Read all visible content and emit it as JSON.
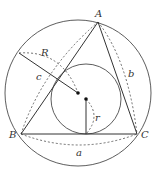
{
  "diagram": {
    "colors": {
      "stroke": "#333333",
      "background": "#ffffff"
    },
    "vertices": {
      "A": {
        "label": "A",
        "x": 98,
        "y": 22
      },
      "B": {
        "label": "B",
        "x": 21,
        "y": 134
      },
      "C": {
        "label": "C",
        "x": 137,
        "y": 134
      }
    },
    "circumcircle": {
      "cx": 78,
      "cy": 93,
      "r": 73
    },
    "incircle": {
      "cx": 86,
      "cy": 99,
      "r": 35
    },
    "labels": {
      "R": "R",
      "r": "r",
      "a": "a",
      "b": "b",
      "c": "c"
    }
  }
}
